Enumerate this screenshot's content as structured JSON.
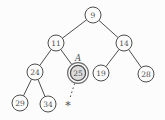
{
  "diagram": {
    "type": "binary-tree",
    "background": "#fcfcfc",
    "edge_color": "#4d4d4d",
    "node_stroke": "#4d4d4d",
    "node_fill": "#fcfcfc",
    "text_color": "#4d4d4d",
    "highlight": {
      "ring_color": "#6f6f6f",
      "fill": "#dcdcdc"
    },
    "node_radius": 8,
    "nodes": [
      {
        "id": "9",
        "label": "9",
        "x": 93,
        "y": 15,
        "highlighted": false
      },
      {
        "id": "11",
        "label": "11",
        "x": 56,
        "y": 43,
        "highlighted": false
      },
      {
        "id": "14",
        "label": "14",
        "x": 124,
        "y": 43,
        "highlighted": false
      },
      {
        "id": "24",
        "label": "24",
        "x": 35,
        "y": 72,
        "highlighted": false
      },
      {
        "id": "25",
        "label": "25",
        "x": 78,
        "y": 73,
        "highlighted": true
      },
      {
        "id": "19",
        "label": "19",
        "x": 101,
        "y": 73,
        "highlighted": false
      },
      {
        "id": "28",
        "label": "28",
        "x": 146,
        "y": 74,
        "highlighted": false
      },
      {
        "id": "29",
        "label": "29",
        "x": 20,
        "y": 103,
        "highlighted": false
      },
      {
        "id": "34",
        "label": "34",
        "x": 48,
        "y": 104,
        "highlighted": false
      }
    ],
    "edges": [
      {
        "from": "9",
        "to": "11",
        "style": "solid"
      },
      {
        "from": "9",
        "to": "14",
        "style": "solid"
      },
      {
        "from": "11",
        "to": "24",
        "style": "solid"
      },
      {
        "from": "11",
        "to": "25",
        "style": "solid"
      },
      {
        "from": "14",
        "to": "19",
        "style": "solid"
      },
      {
        "from": "14",
        "to": "28",
        "style": "solid"
      },
      {
        "from": "24",
        "to": "29",
        "style": "solid"
      },
      {
        "from": "24",
        "to": "34",
        "style": "solid"
      }
    ],
    "annotation": {
      "text": "A",
      "x": 78,
      "y": 61,
      "attached_to": "25"
    },
    "pointer": {
      "symbol": "*",
      "x": 68,
      "y": 104,
      "from": "25",
      "style": "dotted"
    }
  }
}
